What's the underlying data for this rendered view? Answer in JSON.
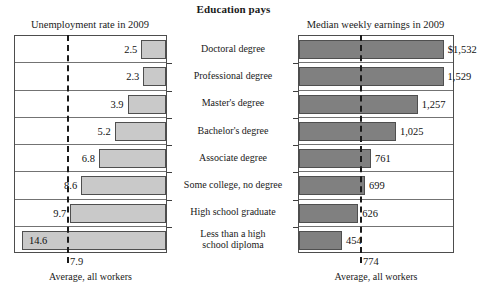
{
  "title": "Education pays",
  "left_panel": {
    "header": "Unemployment rate in 2009",
    "average_value": "7.9",
    "average_caption": "Average, all workers"
  },
  "right_panel": {
    "header": "Median weekly earnings in 2009",
    "average_value": "774",
    "average_caption": "Average, all workers"
  },
  "categories": [
    "Doctoral degree",
    "Professional degree",
    "Master's degree",
    "Bachelor's degree",
    "Associate degree",
    "Some college, no degree",
    "High school graduate",
    "Less than a high\nschool diploma"
  ],
  "unemployment_labels": [
    "2.5",
    "2.3",
    "3.9",
    "5.2",
    "6.8",
    "8.6",
    "9.7",
    "14.6"
  ],
  "earnings_labels": [
    "$1,532",
    "1,529",
    "1,257",
    "1,025",
    "761",
    "699",
    "626",
    "454"
  ],
  "colors": {
    "unemployment_bar": "#c9c9c9",
    "earnings_bar": "#808080",
    "bar_outline": "#4f4f4f",
    "frame": "#4d4d4d",
    "average_line": "#1a1a1a",
    "text": "#1a1a1a",
    "background": "#ffffff"
  },
  "chart_data": {
    "type": "bar",
    "title": "Education pays",
    "orientation": "horizontal",
    "grid": false,
    "legend": "none",
    "categories": [
      "Doctoral degree",
      "Professional degree",
      "Master's degree",
      "Bachelor's degree",
      "Associate degree",
      "Some college, no degree",
      "High school graduate",
      "Less than a high school diploma"
    ],
    "panels": [
      {
        "name": "Unemployment rate in 2009",
        "position": "left",
        "direction": "right-to-left",
        "ylabel": "",
        "xlabel": "Unemployment rate in 2009",
        "unit": "percent",
        "xlim": [
          0,
          15.5
        ],
        "values": [
          2.5,
          2.3,
          3.9,
          5.2,
          6.8,
          8.6,
          9.7,
          14.6
        ],
        "data_labels": [
          "2.5",
          "2.3",
          "3.9",
          "5.2",
          "6.8",
          "8.6",
          "9.7",
          "14.6"
        ],
        "reference_line": {
          "label": "Average, all workers",
          "value": 7.9,
          "value_label": "7.9",
          "style": "dashed"
        },
        "bar_color": "#c9c9c9"
      },
      {
        "name": "Median weekly earnings in 2009",
        "position": "right",
        "direction": "left-to-right",
        "ylabel": "",
        "xlabel": "Median weekly earnings in 2009",
        "unit": "US dollars per week",
        "xlim": [
          0,
          1650
        ],
        "values": [
          1532,
          1529,
          1257,
          1025,
          761,
          699,
          626,
          454
        ],
        "data_labels": [
          "$1,532",
          "1,529",
          "1,257",
          "1,025",
          "761",
          "699",
          "626",
          "454"
        ],
        "reference_line": {
          "label": "Average, all workers",
          "value": 774,
          "value_label": "774",
          "style": "dashed"
        },
        "bar_color": "#808080"
      }
    ]
  }
}
